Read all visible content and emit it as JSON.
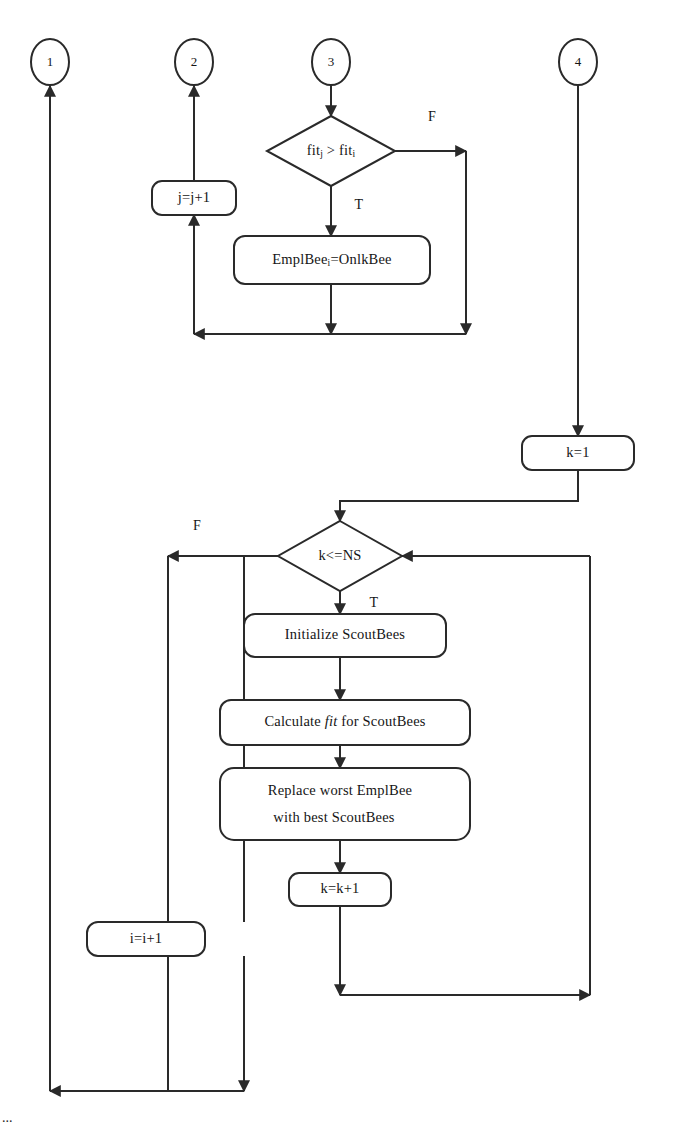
{
  "diagram": {
    "colors": {
      "stroke": "#2a2a2a",
      "fill": "#ffffff",
      "text": "#151515"
    },
    "connectors": [
      {
        "id": "c1",
        "label": "1"
      },
      {
        "id": "c2",
        "label": "2"
      },
      {
        "id": "c3",
        "label": "3"
      },
      {
        "id": "c4",
        "label": "4"
      }
    ],
    "decisions": [
      {
        "id": "d-fit",
        "text_main": "fit",
        "text_sub1": "j",
        "text_op": " > ",
        "text_main2": "fit",
        "text_sub2": "i",
        "true_label": "T",
        "false_label": "F"
      },
      {
        "id": "d-k",
        "text": "k<=NS",
        "true_label": "T",
        "false_label": "F"
      }
    ],
    "processes": [
      {
        "id": "p-jinc",
        "text": "j=j+1"
      },
      {
        "id": "p-empl",
        "text_main": "EmplBee",
        "text_sub": "i",
        "text_tail": "=OnlkBee"
      },
      {
        "id": "p-k1",
        "text": "k=1"
      },
      {
        "id": "p-init-scout",
        "text": "Initialize ScoutBees"
      },
      {
        "id": "p-calc-fit",
        "text_pre": "Calculate ",
        "text_ital": "fit",
        "text_post": " for  ScoutBees"
      },
      {
        "id": "p-replace",
        "line1": "Replace worst EmplBee",
        "line2": "with best ScoutBees"
      },
      {
        "id": "p-kinc",
        "text": "k=k+1"
      },
      {
        "id": "p-iinc",
        "text": "i=i+1"
      }
    ],
    "branch_labels": {
      "fit_false": "F",
      "fit_true": "T",
      "k_false": "F",
      "k_true": "T"
    },
    "caption": "..."
  }
}
